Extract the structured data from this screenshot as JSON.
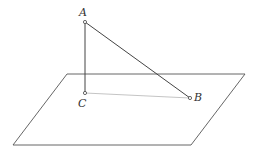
{
  "diagram": {
    "type": "geometry",
    "colors": {
      "background": "#ffffff",
      "line": "#444444",
      "light_line": "#aaaaaa",
      "label": "#333333"
    },
    "plane": {
      "points": [
        [
          67,
          74
        ],
        [
          245,
          74
        ],
        [
          191,
          145
        ],
        [
          13,
          145
        ]
      ]
    },
    "points": [
      {
        "name": "A",
        "label": "A",
        "x": 85,
        "y": 22,
        "label_x": 79,
        "label_y": 16
      },
      {
        "name": "C",
        "label": "C",
        "x": 85,
        "y": 93,
        "label_x": 78,
        "label_y": 107
      },
      {
        "name": "B",
        "label": "B",
        "x": 190,
        "y": 98,
        "label_x": 194,
        "label_y": 101
      }
    ],
    "segments": [
      {
        "name": "AC",
        "from": "A",
        "to": "C",
        "style": "solid"
      },
      {
        "name": "AB",
        "from": "A",
        "to": "B",
        "style": "solid"
      },
      {
        "name": "CB",
        "from": "C",
        "to": "B",
        "style": "light"
      }
    ]
  }
}
